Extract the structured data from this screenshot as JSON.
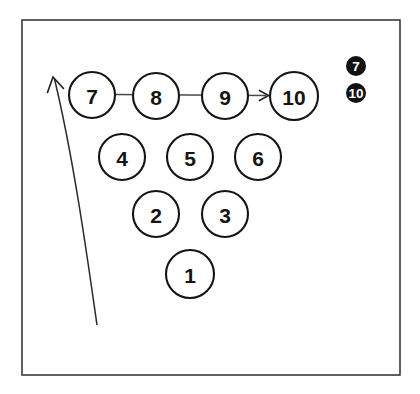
{
  "figure": {
    "background_color": "#ffffff",
    "ink_color": "#141414",
    "frame": {
      "name": "outer-border",
      "x": 22,
      "y": 20,
      "width": 378,
      "height": 355,
      "stroke_color": "#3a3a3a"
    },
    "nodes": [
      {
        "label": "7",
        "cx": 92,
        "cy": 95,
        "r": 23,
        "row": 1
      },
      {
        "label": "8",
        "cx": 156,
        "cy": 96,
        "r": 23,
        "row": 1
      },
      {
        "label": "9",
        "cx": 225,
        "cy": 96,
        "r": 23,
        "row": 1
      },
      {
        "label": "10",
        "cx": 294,
        "cy": 96,
        "r": 24,
        "row": 1
      },
      {
        "label": "4",
        "cx": 122,
        "cy": 157,
        "r": 23,
        "row": 2
      },
      {
        "label": "5",
        "cx": 190,
        "cy": 157,
        "r": 23,
        "row": 2
      },
      {
        "label": "6",
        "cx": 258,
        "cy": 157,
        "r": 23,
        "row": 2
      },
      {
        "label": "2",
        "cx": 156,
        "cy": 214,
        "r": 23,
        "row": 3
      },
      {
        "label": "3",
        "cx": 225,
        "cy": 214,
        "r": 23,
        "row": 3
      },
      {
        "label": "1",
        "cx": 190,
        "cy": 274,
        "r": 24,
        "row": 4
      }
    ],
    "horizontal_arrow": {
      "name": "row-flow-arrow",
      "from_label": "7",
      "to_label": "10",
      "x1": 114,
      "y1": 95,
      "x2": 268,
      "y2": 95,
      "stroke_color": "#4a4a4a",
      "direction": "right"
    },
    "sweep_arrow": {
      "name": "sweep-arrow",
      "start_x": 97,
      "start_y": 325,
      "end_x": 53,
      "end_y": 77,
      "control_x": 72,
      "control_y": 210,
      "stroke_color": "#2b2b2b",
      "direction": "up-left"
    },
    "legend": {
      "items": [
        {
          "label": "7",
          "cx": 356,
          "cy": 66,
          "r": 10,
          "fill": "#111111",
          "text_color": "#ffffff"
        },
        {
          "label": "10",
          "cx": 356,
          "cy": 93,
          "r": 10,
          "fill": "#111111",
          "text_color": "#ffffff"
        }
      ]
    }
  }
}
